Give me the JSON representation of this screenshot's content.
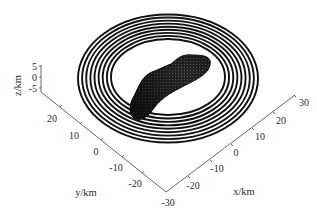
{
  "chart_data": {
    "type": "3d-surface",
    "title": "",
    "xlabel": "x/km",
    "ylabel": "y/km",
    "zlabel": "z/km",
    "xlim": [
      -30,
      30
    ],
    "ylim": [
      -30,
      30
    ],
    "zlim": [
      -5,
      5
    ],
    "x_ticks": [
      "-20",
      "-10",
      "0",
      "10",
      "20",
      "30"
    ],
    "y_ticks": [
      "20",
      "10",
      "0",
      "-10",
      "-20",
      "-30"
    ],
    "z_ticks": [
      "5",
      "0",
      "-5"
    ],
    "rings": {
      "count": 9,
      "inner_radius_km": 19,
      "outer_radius_km": 30,
      "color": "#111111"
    },
    "body": {
      "shape": "elongated bilobed asteroid",
      "approx_length_km": 20,
      "color": "#1c1c1c"
    },
    "grid": false,
    "legend": null
  }
}
